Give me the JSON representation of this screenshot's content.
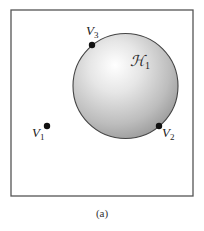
{
  "figure": {
    "caption": "(a)",
    "frame": {
      "x": 11,
      "y": 10,
      "width": 182,
      "height": 186,
      "stroke": "#555555"
    },
    "region": {
      "label_main": "ℋ",
      "label_sub": "1",
      "cx": 125.5,
      "cy": 86,
      "r": 52.5,
      "fill_light": "#ffffff",
      "fill_dark": "#9a9a9a",
      "stroke": "#444444"
    },
    "vertices": [
      {
        "id": "V1",
        "label_main": "V",
        "label_sub": "1",
        "x": 47,
        "y": 126,
        "on_boundary": false
      },
      {
        "id": "V2",
        "label_main": "V",
        "label_sub": "2",
        "x": 159,
        "y": 126,
        "on_boundary": true
      },
      {
        "id": "V3",
        "label_main": "V",
        "label_sub": "3",
        "x": 92,
        "y": 45,
        "on_boundary": true
      }
    ],
    "vertex_color": "#111111"
  }
}
